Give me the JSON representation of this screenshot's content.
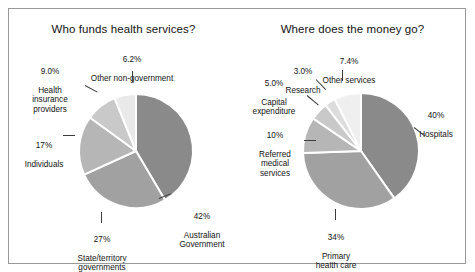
{
  "figure": {
    "background": "#ffffff",
    "frame_color": "#9a9a9a",
    "text_color": "#141414"
  },
  "chart_data": [
    {
      "type": "pie",
      "id": "who-funds-health-services",
      "title": "Who funds health services?",
      "xlabel": "",
      "ylabel": "",
      "legend_position": "none",
      "grid": false,
      "start_angle_deg": 0,
      "direction": "clockwise",
      "categories": [
        "Australian Government",
        "State/territory governments",
        "Individuals",
        "Health insurance providers",
        "Other non-government"
      ],
      "values": [
        42,
        27,
        17,
        9.0,
        6.2
      ],
      "value_labels": [
        "42%",
        "27%",
        "17%",
        "9.0%",
        "6.2%"
      ],
      "colors": [
        "#8a8a8a",
        "#a1a1a1",
        "#b6b6b6",
        "#c9c9c9",
        "#e9e9e9"
      ],
      "slices": [
        {
          "pct_text": "42%",
          "name_text": "Australian\nGovernment",
          "value": 42,
          "color": "#8a8a8a"
        },
        {
          "pct_text": "27%",
          "name_text": "State/territory\ngovernments",
          "value": 27,
          "color": "#a1a1a1"
        },
        {
          "pct_text": "17%",
          "name_text": "Individuals",
          "value": 17,
          "color": "#b6b6b6"
        },
        {
          "pct_text": "9.0%",
          "name_text": "Health\ninsurance\nproviders",
          "value": 9.0,
          "color": "#c9c9c9"
        },
        {
          "pct_text": "6.2%",
          "name_text": "Other non-government",
          "value": 6.2,
          "color": "#e9e9e9"
        }
      ]
    },
    {
      "type": "pie",
      "id": "where-does-the-money-go",
      "title": "Where does the money go?",
      "xlabel": "",
      "ylabel": "",
      "legend_position": "none",
      "grid": false,
      "start_angle_deg": 0,
      "direction": "clockwise",
      "categories": [
        "Hospitals",
        "Primary health care",
        "Referred medical services",
        "Capital expenditure",
        "Research",
        "Other services"
      ],
      "values": [
        40,
        34,
        10,
        5.0,
        3.0,
        7.4
      ],
      "value_labels": [
        "40%",
        "34%",
        "10%",
        "5.0%",
        "3.0%",
        "7.4%"
      ],
      "colors": [
        "#8a8a8a",
        "#a1a1a1",
        "#b6b6b6",
        "#c9c9c9",
        "#dcdcdc",
        "#efefef"
      ],
      "slices": [
        {
          "pct_text": "40%",
          "name_text": "Hospitals",
          "value": 40,
          "color": "#8a8a8a"
        },
        {
          "pct_text": "34%",
          "name_text": "Primary\nhealth care",
          "value": 34,
          "color": "#a1a1a1"
        },
        {
          "pct_text": "10%",
          "name_text": "Referred\nmedical\nservices",
          "value": 10,
          "color": "#b6b6b6"
        },
        {
          "pct_text": "5.0%",
          "name_text": "Capital\nexpenditure",
          "value": 5.0,
          "color": "#c9c9c9"
        },
        {
          "pct_text": "3.0%",
          "name_text": "Research",
          "value": 3.0,
          "color": "#dcdcdc"
        },
        {
          "pct_text": "7.4%",
          "name_text": "Other services",
          "value": 7.4,
          "color": "#efefef"
        }
      ]
    }
  ],
  "left_chart": {
    "title": "Who funds health services?",
    "labels": {
      "australian_government": {
        "pct": "42%",
        "name": "Australian\nGovernment"
      },
      "state_territory": {
        "pct": "27%",
        "name": "State/territory\ngovernments"
      },
      "individuals": {
        "pct": "17%",
        "name": "Individuals"
      },
      "health_insurance": {
        "pct": "9.0%",
        "name": "Health\ninsurance\nproviders"
      },
      "other_non_government": {
        "pct": "6.2%",
        "name": "Other non-government"
      }
    }
  },
  "right_chart": {
    "title": "Where does the money go?",
    "labels": {
      "hospitals": {
        "pct": "40%",
        "name": "Hospitals"
      },
      "primary_health": {
        "pct": "34%",
        "name": "Primary\nhealth care"
      },
      "referred_medical": {
        "pct": "10%",
        "name": "Referred\nmedical\nservices"
      },
      "capital_expenditure": {
        "pct": "5.0%",
        "name": "Capital\nexpenditure"
      },
      "research": {
        "pct": "3.0%",
        "name": "Research"
      },
      "other_services": {
        "pct": "7.4%",
        "name": "Other services"
      }
    }
  }
}
